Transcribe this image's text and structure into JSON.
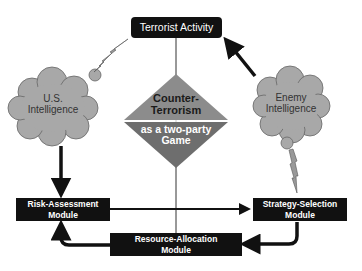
{
  "diagram": {
    "top_node": {
      "label": "Terrorist Activity"
    },
    "center": {
      "top_line1": "Counter-",
      "top_line2": "Terrorism",
      "bottom_line1": "as a two-party",
      "bottom_line2": "Game"
    },
    "clouds": {
      "left": {
        "line1": "U.S.",
        "line2": "Intelligence"
      },
      "right": {
        "line1": "Enemy",
        "line2": "Intelligence"
      }
    },
    "modules": {
      "risk": {
        "line1": "Risk-Assessment",
        "line2": "Module"
      },
      "strategy": {
        "line1": "Strategy-Selection",
        "line2": "Module"
      },
      "resource": {
        "line1": "Resource-Allocation",
        "line2": "Module"
      }
    },
    "edges": [
      {
        "from": "Enemy Intelligence",
        "to": "Terrorist Activity",
        "type": "arrow"
      },
      {
        "from": "U.S. Intelligence",
        "to": "Risk-Assessment Module",
        "type": "arrow"
      },
      {
        "from": "Risk-Assessment Module",
        "to": "Strategy-Selection Module",
        "type": "arrow"
      },
      {
        "from": "Strategy-Selection Module",
        "to": "Resource-Allocation Module",
        "type": "curved-arrow"
      },
      {
        "from": "Resource-Allocation Module",
        "to": "Risk-Assessment Module",
        "type": "curved-arrow"
      },
      {
        "from": "Terrorist Activity",
        "to": "U.S. Intelligence",
        "type": "lightning"
      },
      {
        "from": "Enemy Intelligence",
        "to": "Strategy-Selection Module",
        "type": "lightning"
      }
    ],
    "colors": {
      "box": "#111111",
      "cloud": "#a8a8a8",
      "diamond_top": "#8c8c8c",
      "diamond_bottom": "#6e6e6e"
    }
  }
}
